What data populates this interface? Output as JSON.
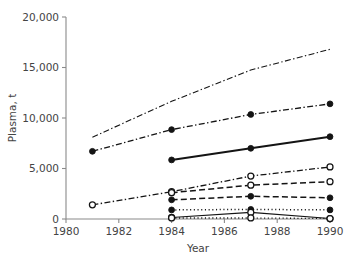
{
  "chart_data": {
    "type": "line",
    "title": "",
    "xlabel": "Year",
    "ylabel": "Plasma, t",
    "xlim": [
      1980,
      1990
    ],
    "ylim": [
      0,
      20000
    ],
    "xticks": [
      1980,
      1982,
      1984,
      1986,
      1988,
      1990
    ],
    "xtick_labels": [
      "1980",
      "1982",
      "1984",
      "1986",
      "1988",
      "1990"
    ],
    "yticks": [
      0,
      5000,
      10000,
      15000,
      20000
    ],
    "ytick_labels": [
      "0",
      "5,000",
      "10,000",
      "15,000",
      "20,000"
    ],
    "grid": false,
    "legend": "none",
    "series": [
      {
        "name": "series-1-dashdot-nomarker",
        "style": "dashdot",
        "marker": "none",
        "linewidth": 1.1,
        "x": [
          1981,
          1984,
          1987,
          1990
        ],
        "values": [
          8100,
          11650,
          14750,
          16800
        ]
      },
      {
        "name": "series-2-dashdot-filled",
        "style": "dashdot",
        "marker": "filled-circle",
        "linewidth": 1.3,
        "x": [
          1981,
          1984,
          1987,
          1990
        ],
        "values": [
          6700,
          8850,
          10350,
          11400
        ]
      },
      {
        "name": "series-3-solid-filled",
        "style": "solid",
        "marker": "filled-circle",
        "linewidth": 2.1,
        "x": [
          1984,
          1987,
          1990
        ],
        "values": [
          5850,
          7000,
          8150
        ]
      },
      {
        "name": "series-4-dashdot-open",
        "style": "dashdot",
        "marker": "open-circle",
        "linewidth": 1.3,
        "x": [
          1981,
          1984,
          1987,
          1990
        ],
        "values": [
          1400,
          2700,
          4250,
          5150
        ]
      },
      {
        "name": "series-5-dashed-open",
        "style": "dashed",
        "marker": "open-circle",
        "linewidth": 1.5,
        "x": [
          1984,
          1987,
          1990
        ],
        "values": [
          2600,
          3350,
          3700
        ]
      },
      {
        "name": "series-6-dashed-filled",
        "style": "dashed",
        "marker": "filled-circle",
        "linewidth": 1.5,
        "x": [
          1984,
          1987,
          1990
        ],
        "values": [
          1900,
          2250,
          2100
        ]
      },
      {
        "name": "series-7-dotted-filled",
        "style": "dotted",
        "marker": "filled-circle",
        "linewidth": 1.5,
        "x": [
          1984,
          1987,
          1990
        ],
        "values": [
          900,
          950,
          900
        ]
      },
      {
        "name": "series-8-solid-open",
        "style": "solid",
        "marker": "open-circle",
        "linewidth": 1.2,
        "x": [
          1984,
          1987,
          1990
        ],
        "values": [
          150,
          650,
          50
        ]
      },
      {
        "name": "series-9-dotted-open",
        "style": "dotted",
        "marker": "open-circle",
        "linewidth": 1.3,
        "x": [
          1984,
          1987,
          1990
        ],
        "values": [
          100,
          100,
          50
        ]
      }
    ],
    "colors": {
      "line": "#141414",
      "axis": "#8a8a8a",
      "text": "#444444",
      "background": "#ffffff"
    }
  }
}
